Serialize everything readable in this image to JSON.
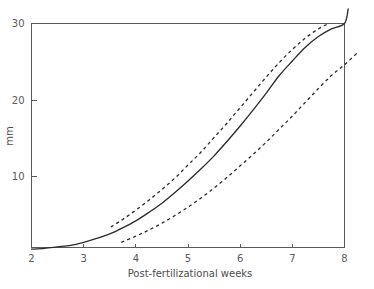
{
  "chart_data": {
    "type": "line",
    "title": "",
    "xlabel": "Post-fertilizational weeks",
    "ylabel": "mm",
    "xlim": [
      2,
      8
    ],
    "ylim": [
      0,
      30
    ],
    "xticks": [
      2,
      3,
      4,
      5,
      6,
      7,
      8
    ],
    "xticklabels": [
      "2",
      "3",
      "4",
      "5",
      "6",
      "7",
      "8"
    ],
    "yticks": [
      10,
      20,
      30
    ],
    "yticklabels": [
      "10",
      "20",
      "30"
    ],
    "grid": false,
    "legend": "none",
    "frame": "box",
    "series": [
      {
        "name": "median",
        "style": "solid",
        "x": [
          2.0,
          2.25,
          2.5,
          2.75,
          3.0,
          3.25,
          3.5,
          3.75,
          4.0,
          4.25,
          4.5,
          4.75,
          5.0,
          5.25,
          5.5,
          5.75,
          6.0,
          6.25,
          6.5,
          6.75,
          7.0,
          7.25,
          7.5,
          7.75,
          8.0,
          8.07
        ],
        "y": [
          0.5,
          0.6,
          0.8,
          1.0,
          1.4,
          1.9,
          2.5,
          3.3,
          4.2,
          5.3,
          6.5,
          7.9,
          9.4,
          11.0,
          12.7,
          14.6,
          16.6,
          18.7,
          20.9,
          23.2,
          25.1,
          26.9,
          28.3,
          29.3,
          30.0,
          31.9
        ]
      },
      {
        "name": "upper-limit",
        "style": "dashed",
        "x": [
          3.52,
          3.75,
          4.0,
          4.25,
          4.5,
          4.75,
          5.0,
          5.25,
          5.5,
          5.75,
          6.0,
          6.25,
          6.5,
          6.75,
          7.0,
          7.25,
          7.5,
          7.7
        ],
        "y": [
          3.4,
          4.4,
          5.6,
          6.9,
          8.3,
          9.8,
          11.5,
          13.2,
          15.1,
          17.0,
          19.0,
          21.0,
          23.0,
          24.9,
          26.6,
          28.1,
          29.3,
          30.0
        ]
      },
      {
        "name": "lower-limit",
        "style": "dashed",
        "x": [
          3.72,
          4.0,
          4.25,
          4.5,
          4.75,
          5.0,
          5.25,
          5.5,
          5.75,
          6.0,
          6.25,
          6.5,
          6.75,
          7.0,
          7.25,
          7.5,
          7.75,
          8.0,
          8.25
        ],
        "y": [
          1.4,
          2.2,
          3.0,
          3.9,
          4.9,
          6.0,
          7.2,
          8.5,
          9.9,
          11.4,
          12.9,
          14.5,
          16.2,
          17.9,
          19.7,
          21.5,
          23.2,
          24.6,
          26.2
        ]
      }
    ]
  },
  "colors": {
    "curve": "#2b2b2b",
    "axis": "#5a5a5a",
    "text": "#5c5c5c",
    "background": "#ffffff"
  }
}
